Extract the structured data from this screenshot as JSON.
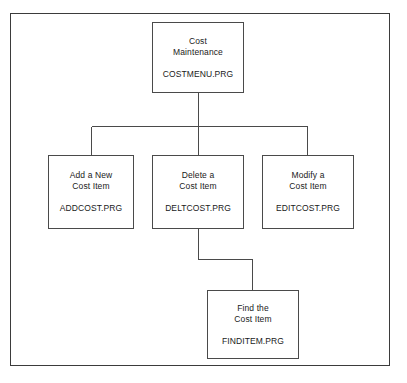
{
  "diagram": {
    "type": "hierarchy-flowchart",
    "frame": {
      "name": "outer-border"
    },
    "nodes": [
      {
        "id": "root",
        "title": "Cost\nMaintenance",
        "file": "COSTMENU.PRG"
      },
      {
        "id": "add",
        "title": "Add a New\nCost Item",
        "file": "ADDCOST.PRG"
      },
      {
        "id": "delete",
        "title": "Delete a\nCost Item",
        "file": "DELTCOST.PRG"
      },
      {
        "id": "modify",
        "title": "Modify a\nCost Item",
        "file": "EDITCOST.PRG"
      },
      {
        "id": "find",
        "title": "Find the\nCost Item",
        "file": "FINDITEM.PRG"
      }
    ],
    "edges": [
      {
        "from": "root",
        "to": "add"
      },
      {
        "from": "root",
        "to": "delete"
      },
      {
        "from": "root",
        "to": "modify"
      },
      {
        "from": "delete",
        "to": "find"
      }
    ],
    "colors": {
      "line": "#4a4a4a",
      "frame": "#3b3b3b",
      "background": "#ffffff",
      "text": "#1a1a1a"
    }
  }
}
